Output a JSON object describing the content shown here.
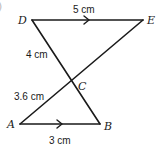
{
  "figure": {
    "partial_label": ")",
    "vertices": {
      "D": {
        "label": "D",
        "x": 32,
        "y": 20,
        "lx": 18,
        "ly": 24
      },
      "E": {
        "label": "E",
        "x": 143,
        "y": 20,
        "lx": 147,
        "ly": 24
      },
      "C": {
        "label": "C",
        "x": 72,
        "y": 82,
        "lx": 78,
        "ly": 90
      },
      "A": {
        "label": "A",
        "x": 20,
        "y": 124,
        "lx": 7,
        "ly": 128
      },
      "B": {
        "label": "B",
        "x": 100,
        "y": 124,
        "lx": 104,
        "ly": 130
      }
    },
    "segments": [
      {
        "name": "DE",
        "from": "D",
        "to": "E",
        "parallel_arrow": true
      },
      {
        "name": "AB",
        "from": "A",
        "to": "B",
        "parallel_arrow": true
      },
      {
        "name": "DB",
        "from": "D",
        "to": "B",
        "parallel_arrow": false
      },
      {
        "name": "AE",
        "from": "A",
        "to": "E",
        "parallel_arrow": false
      }
    ],
    "measurements": {
      "DE": {
        "text": "5 cm",
        "x": 73,
        "y": 13
      },
      "DC": {
        "text": "4 cm",
        "x": 26,
        "y": 58
      },
      "AC": {
        "text": "3.6 cm",
        "x": 14,
        "y": 100
      },
      "AB": {
        "text": "3 cm",
        "x": 49,
        "y": 144
      }
    },
    "line_color": "#1a1a1a"
  }
}
